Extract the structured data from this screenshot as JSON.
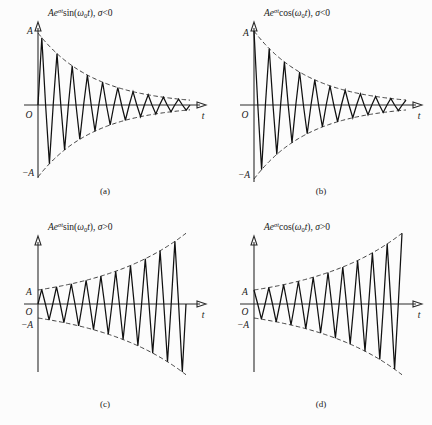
{
  "figure": {
    "background_color": "#fcfcfc",
    "line_color": "#111111",
    "axis_color": "#2b2b2b"
  },
  "panels": [
    {
      "id": "a",
      "caption": "(a)",
      "equation_prefix": "Ae",
      "equation_exponent": "σt",
      "equation_func": "sin(ω",
      "equation_sub": "0",
      "equation_tail": "t), σ<0",
      "equation_plain": "Aeσt sin(ω0t), σ<0",
      "y_axis_label": "t",
      "origin_label": "O",
      "top_tick_label": "A",
      "bottom_tick_label": "−A",
      "has_mid_minus_a": false
    },
    {
      "id": "b",
      "caption": "(b)",
      "equation_prefix": "Ae",
      "equation_exponent": "σt",
      "equation_func": "cos(ω",
      "equation_sub": "0",
      "equation_tail": "t), σ<0",
      "equation_plain": "Aeσt cos(ω0t), σ<0",
      "y_axis_label": "t",
      "origin_label": "O",
      "top_tick_label": "A",
      "bottom_tick_label": "−A",
      "has_mid_minus_a": false
    },
    {
      "id": "c",
      "caption": "(c)",
      "equation_prefix": "Ae",
      "equation_exponent": "σt",
      "equation_func": "sin(ω",
      "equation_sub": "0",
      "equation_tail": "t), σ>0",
      "equation_plain": "Aeσt sin(ω0t), σ>0",
      "y_axis_label": "t",
      "origin_label": "O",
      "top_tick_label": "A",
      "bottom_tick_label": "−A",
      "has_mid_minus_a": true
    },
    {
      "id": "d",
      "caption": "(d)",
      "equation_prefix": "Ae",
      "equation_exponent": "σt",
      "equation_func": "cos(ω",
      "equation_sub": "0",
      "equation_tail": "t), σ>0",
      "equation_plain": "Aeσt cos(ω0t), σ>0",
      "y_axis_label": "t",
      "origin_label": "O",
      "top_tick_label": "A",
      "bottom_tick_label": "−A",
      "has_mid_minus_a": true
    }
  ],
  "chart_data": [
    {
      "type": "line",
      "id": "a",
      "title": "Aeσt sin(ω0t), σ<0",
      "xlabel": "t",
      "ylabel": "",
      "function": "A*exp(sigma*t)*sin(omega0*t)",
      "sigma_sign": "negative",
      "amplitude_label": "A",
      "cycles": 10,
      "decay_ratio_end": 0.07,
      "envelope": "dashed exponential decay",
      "ylim": [
        -1,
        1
      ],
      "xlim": [
        0,
        10
      ],
      "grid": false,
      "legend": "none",
      "x": [
        0,
        0.5,
        1,
        1.5,
        2,
        2.5,
        3,
        3.5,
        4,
        4.5,
        5,
        5.5,
        6,
        6.5,
        7,
        7.5,
        8,
        8.5,
        9,
        9.5,
        10
      ],
      "values": [
        0,
        1.0,
        0,
        -0.76,
        0,
        0.58,
        0,
        -0.44,
        0,
        0.33,
        0,
        -0.25,
        0,
        0.19,
        0,
        -0.15,
        0,
        0.11,
        0,
        -0.085,
        0
      ]
    },
    {
      "type": "line",
      "id": "b",
      "title": "Aeσt cos(ω0t), σ<0",
      "xlabel": "t",
      "ylabel": "",
      "function": "A*exp(sigma*t)*cos(omega0*t)",
      "sigma_sign": "negative",
      "amplitude_label": "A",
      "cycles": 10,
      "decay_ratio_end": 0.07,
      "envelope": "dashed exponential decay",
      "ylim": [
        -1,
        1
      ],
      "xlim": [
        0,
        10
      ],
      "grid": false,
      "legend": "none",
      "x": [
        0,
        0.5,
        1,
        1.5,
        2,
        2.5,
        3,
        3.5,
        4,
        4.5,
        5,
        5.5,
        6,
        6.5,
        7,
        7.5,
        8,
        8.5,
        9,
        9.5,
        10
      ],
      "values": [
        1.0,
        0,
        -0.87,
        0,
        0.66,
        0,
        -0.5,
        0,
        0.38,
        0,
        -0.29,
        0,
        0.22,
        0,
        -0.17,
        0,
        0.13,
        0,
        -0.1,
        0,
        0.075
      ]
    },
    {
      "type": "line",
      "id": "c",
      "title": "Aeσt sin(ω0t), σ>0",
      "xlabel": "t",
      "ylabel": "",
      "function": "A*exp(sigma*t)*sin(omega0*t)",
      "sigma_sign": "positive",
      "amplitude_label": "A",
      "cycles": 10,
      "growth_ratio_end": 4.0,
      "envelope": "dashed exponential growth",
      "ylim": [
        -4,
        4
      ],
      "xlim": [
        0,
        10
      ],
      "grid": false,
      "legend": "none",
      "x": [
        0,
        0.5,
        1,
        1.5,
        2,
        2.5,
        3,
        3.5,
        4,
        4.5,
        5,
        5.5,
        6,
        6.5,
        7,
        7.5,
        8,
        8.5,
        9,
        9.5,
        10
      ],
      "values": [
        0,
        1.0,
        0,
        -1.17,
        0,
        1.37,
        0,
        -1.61,
        0,
        1.89,
        0,
        -2.22,
        0,
        2.6,
        0,
        -3.05,
        0,
        3.58,
        0,
        -4.2,
        0
      ]
    },
    {
      "type": "line",
      "id": "d",
      "title": "Aeσt cos(ω0t), σ>0",
      "xlabel": "t",
      "ylabel": "",
      "function": "A*exp(sigma*t)*cos(omega0*t)",
      "sigma_sign": "positive",
      "amplitude_label": "A",
      "cycles": 10,
      "growth_ratio_end": 4.0,
      "envelope": "dashed exponential growth",
      "ylim": [
        -4,
        4
      ],
      "xlim": [
        0,
        10
      ],
      "grid": false,
      "legend": "none",
      "x": [
        0,
        0.5,
        1,
        1.5,
        2,
        2.5,
        3,
        3.5,
        4,
        4.5,
        5,
        5.5,
        6,
        6.5,
        7,
        7.5,
        8,
        8.5,
        9,
        9.5,
        10
      ],
      "values": [
        1.0,
        0,
        -1.17,
        0,
        1.37,
        0,
        -1.61,
        0,
        1.89,
        0,
        -2.22,
        0,
        2.6,
        0,
        -3.05,
        0,
        3.58,
        0,
        -4.2,
        0,
        4.92
      ]
    }
  ]
}
